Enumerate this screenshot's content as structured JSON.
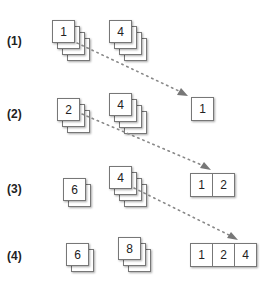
{
  "steps": [
    {
      "label": "(1)",
      "left_stack": {
        "value": "1",
        "count": 4
      },
      "right_stack": {
        "value": "4",
        "count": 4
      },
      "output": [
        "1"
      ]
    },
    {
      "label": "(2)",
      "left_stack": {
        "value": "2",
        "count": 3
      },
      "right_stack": {
        "value": "4",
        "count": 4
      },
      "output": [
        "1",
        "2"
      ]
    },
    {
      "label": "(3)",
      "left_stack": {
        "value": "6",
        "count": 2
      },
      "right_stack": {
        "value": "4",
        "count": 4
      },
      "output": [
        "1",
        "2",
        "4"
      ]
    },
    {
      "label": "(4)",
      "left_stack": {
        "value": "6",
        "count": 2
      },
      "right_stack": {
        "value": "8",
        "count": 3
      },
      "output": [
        "1",
        "2",
        "4"
      ]
    }
  ],
  "colors": {
    "arrow": "#888888",
    "border": "#777777"
  }
}
